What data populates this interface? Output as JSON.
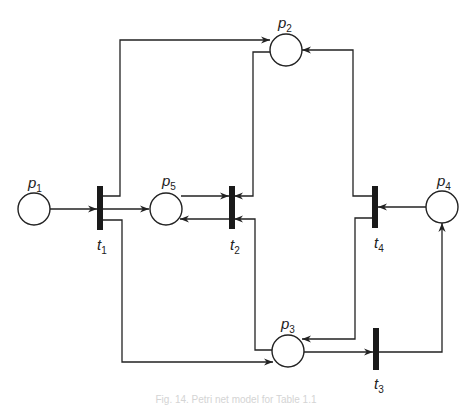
{
  "diagram": {
    "type": "petri-net",
    "caption": "Fig. 14. Petri net model for Table 1.1",
    "places": [
      {
        "id": "p1",
        "name": "p",
        "sub": "1",
        "cx": 34,
        "cy": 209
      },
      {
        "id": "p2",
        "name": "p",
        "sub": "2",
        "cx": 286,
        "cy": 50
      },
      {
        "id": "p3",
        "name": "p",
        "sub": "3",
        "cx": 288,
        "cy": 351
      },
      {
        "id": "p4",
        "name": "p",
        "sub": "4",
        "cx": 442,
        "cy": 207
      },
      {
        "id": "p5",
        "name": "p",
        "sub": "5",
        "cx": 166,
        "cy": 209
      }
    ],
    "transitions": [
      {
        "id": "t1",
        "name": "t",
        "sub": "1"
      },
      {
        "id": "t2",
        "name": "t",
        "sub": "2"
      },
      {
        "id": "t3",
        "name": "t",
        "sub": "3"
      },
      {
        "id": "t4",
        "name": "t",
        "sub": "4"
      }
    ],
    "arcs": [
      {
        "from": "p1",
        "to": "t1"
      },
      {
        "from": "t1",
        "to": "p2"
      },
      {
        "from": "t1",
        "to": "p5"
      },
      {
        "from": "t1",
        "to": "p3"
      },
      {
        "from": "p5",
        "to": "t2"
      },
      {
        "from": "t2",
        "to": "p5"
      },
      {
        "from": "p2",
        "to": "t2"
      },
      {
        "from": "p3",
        "to": "t2"
      },
      {
        "from": "p3",
        "to": "t3"
      },
      {
        "from": "t3",
        "to": "p4"
      },
      {
        "from": "p4",
        "to": "t4"
      },
      {
        "from": "t4",
        "to": "p2"
      },
      {
        "from": "t4",
        "to": "p3"
      }
    ]
  },
  "labels": {
    "p1": {
      "main": "p",
      "sub": "1"
    },
    "p2": {
      "main": "p",
      "sub": "2"
    },
    "p3": {
      "main": "p",
      "sub": "3"
    },
    "p4": {
      "main": "p",
      "sub": "4"
    },
    "p5": {
      "main": "p",
      "sub": "5"
    },
    "t1": {
      "main": "t",
      "sub": "1"
    },
    "t2": {
      "main": "t",
      "sub": "2"
    },
    "t3": {
      "main": "t",
      "sub": "3"
    },
    "t4": {
      "main": "t",
      "sub": "4"
    }
  },
  "colors": {
    "stroke": "#222222",
    "transition_fill": "#1a1a1a",
    "caption": "#d4d4d4"
  }
}
